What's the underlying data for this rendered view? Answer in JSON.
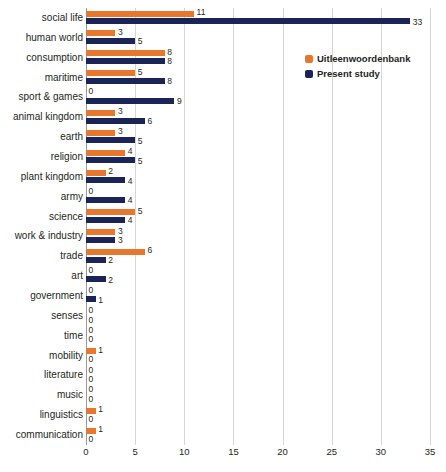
{
  "chart_data": {
    "type": "bar",
    "orientation": "horizontal",
    "title": "",
    "xlabel": "",
    "ylabel": "",
    "xlim": [
      0,
      35
    ],
    "xticks": [
      0,
      5,
      10,
      15,
      20,
      25,
      30,
      35
    ],
    "grid": true,
    "legend_position": "upper-right-inside",
    "categories": [
      "social life",
      "human world",
      "consumption",
      "maritime",
      "sport & games",
      "animal kingdom",
      "earth",
      "religion",
      "plant kingdom",
      "army",
      "science",
      "work & industry",
      "trade",
      "art",
      "government",
      "senses",
      "time",
      "mobility",
      "literature",
      "music",
      "linguistics",
      "communication"
    ],
    "series": [
      {
        "name": "Uitleenwoordenbank",
        "color": "#e8772e",
        "values": [
          11,
          3,
          8,
          5,
          0,
          3,
          3,
          4,
          2,
          0,
          5,
          3,
          6,
          0,
          0,
          0,
          0,
          1,
          0,
          0,
          1,
          1
        ]
      },
      {
        "name": "Present study",
        "color": "#1b2456",
        "values": [
          33,
          5,
          8,
          8,
          9,
          6,
          5,
          5,
          4,
          4,
          4,
          3,
          2,
          2,
          1,
          0,
          0,
          0,
          0,
          0,
          0,
          0
        ]
      }
    ]
  }
}
